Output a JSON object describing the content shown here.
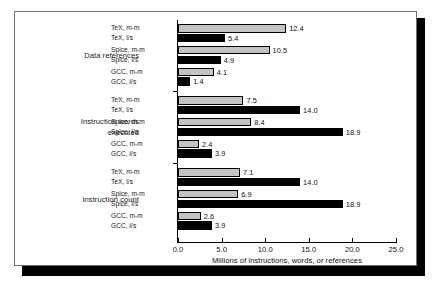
{
  "chart_data": {
    "type": "bar",
    "orientation": "horizontal",
    "title": "",
    "xlabel": "Millions of instructions, words, or references",
    "ylabel": "",
    "xlim": [
      0.0,
      25.0
    ],
    "xticks": [
      "0.0",
      "5.0",
      "10.0",
      "15.0",
      "20.0",
      "25.0"
    ],
    "xtick_values": [
      0.0,
      5.0,
      10.0,
      15.0,
      20.0,
      25.0
    ],
    "grid": false,
    "legend": "none",
    "series_colors": {
      "m-m": "#c3c3c3",
      "l/s": "#000000"
    },
    "groups": [
      {
        "label_line1": "Data references",
        "label_line2": "",
        "bars": [
          {
            "label": "TeX, m-m",
            "value": 12.4,
            "display": "12.4",
            "style": "mm"
          },
          {
            "label": "TeX, l/s",
            "value": 5.4,
            "display": "5.4",
            "style": "ls"
          },
          {
            "label": "Spice, m-m",
            "value": 10.5,
            "display": "10.5",
            "style": "mm"
          },
          {
            "label": "Spice, l/s",
            "value": 4.9,
            "display": "4.9",
            "style": "ls"
          },
          {
            "label": "GCC, m-m",
            "value": 4.1,
            "display": "4.1",
            "style": "mm"
          },
          {
            "label": "GCC, l/s",
            "value": 1.4,
            "display": "1.4",
            "style": "ls"
          }
        ]
      },
      {
        "label_line1": "Instruction words",
        "label_line2": "executed",
        "bars": [
          {
            "label": "TeX, m-m",
            "value": 7.5,
            "display": "7.5",
            "style": "mm"
          },
          {
            "label": "TeX, l/s",
            "value": 14.0,
            "display": "14.0",
            "style": "ls"
          },
          {
            "label": "Spice, m-m",
            "value": 8.4,
            "display": "8.4",
            "style": "mm"
          },
          {
            "label": "Spice, l/s",
            "value": 18.9,
            "display": "18.9",
            "style": "ls"
          },
          {
            "label": "GCC, m-m",
            "value": 2.4,
            "display": "2.4",
            "style": "mm"
          },
          {
            "label": "GCC, l/s",
            "value": 3.9,
            "display": "3.9",
            "style": "ls"
          }
        ]
      },
      {
        "label_line1": "Instruction count",
        "label_line2": "",
        "bars": [
          {
            "label": "TeX, m-m",
            "value": 7.1,
            "display": "7.1",
            "style": "mm"
          },
          {
            "label": "TeX, l/s",
            "value": 14.0,
            "display": "14.0",
            "style": "ls"
          },
          {
            "label": "Spice, m-m",
            "value": 6.9,
            "display": "6.9",
            "style": "mm"
          },
          {
            "label": "Spice, l/s",
            "value": 18.9,
            "display": "18.9",
            "style": "ls"
          },
          {
            "label": "GCC, m-m",
            "value": 2.6,
            "display": "2.6",
            "style": "mm"
          },
          {
            "label": "GCC, l/s",
            "value": 3.9,
            "display": "3.9",
            "style": "ls"
          }
        ]
      }
    ]
  }
}
